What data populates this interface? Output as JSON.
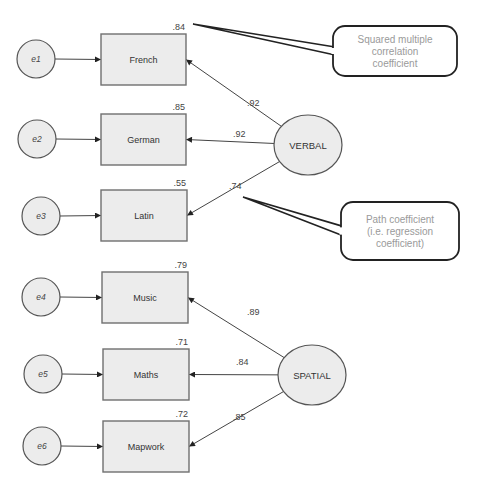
{
  "colors": {
    "node_fill": "#ececec",
    "node_stroke": "#707070",
    "edge": "#444444",
    "callout_text": "#9a9a9a",
    "callout_stroke": "#222222"
  },
  "latent_factors": [
    {
      "id": "VERBAL",
      "label": "VERBAL",
      "cx": 308,
      "cy": 145,
      "rx": 34,
      "ry": 30
    },
    {
      "id": "SPATIAL",
      "label": "SPATIAL",
      "cx": 312,
      "cy": 375,
      "rx": 34,
      "ry": 30
    }
  ],
  "observed": [
    {
      "label": "French",
      "x": 101,
      "y": 34,
      "w": 85,
      "h": 51,
      "r2": ".84",
      "factor": "VERBAL",
      "loading": ".92",
      "error": "e1",
      "ex": 36,
      "ey": 59
    },
    {
      "label": "German",
      "x": 101,
      "y": 114,
      "w": 85,
      "h": 51,
      "r2": ".85",
      "factor": "VERBAL",
      "loading": ".92",
      "error": "e2",
      "ex": 37,
      "ey": 139
    },
    {
      "label": "Latin",
      "x": 101,
      "y": 190,
      "w": 86,
      "h": 51,
      "r2": ".55",
      "factor": "VERBAL",
      "loading": ".74",
      "error": "e3",
      "ex": 41,
      "ey": 216
    },
    {
      "label": "Music",
      "x": 102,
      "y": 272,
      "w": 86,
      "h": 51,
      "r2": ".79",
      "factor": "SPATIAL",
      "loading": ".89",
      "error": "e4",
      "ex": 41,
      "ey": 297
    },
    {
      "label": "Maths",
      "x": 103,
      "y": 349,
      "w": 86,
      "h": 51,
      "r2": ".71",
      "factor": "SPATIAL",
      "loading": ".84",
      "error": "e5",
      "ex": 43,
      "ey": 374
    },
    {
      "label": "Mapwork",
      "x": 103,
      "y": 421,
      "w": 86,
      "h": 51,
      "r2": ".72",
      "factor": "SPATIAL",
      "loading": ".85",
      "error": "e6",
      "ex": 42,
      "ey": 446
    }
  ],
  "loading_label_pos": [
    {
      "x": 247,
      "y": 106
    },
    {
      "x": 233,
      "y": 137
    },
    {
      "x": 229,
      "y": 189
    },
    {
      "x": 247,
      "y": 315
    },
    {
      "x": 236,
      "y": 365
    },
    {
      "x": 233,
      "y": 420
    }
  ],
  "callouts": [
    {
      "id": "squared-multiple-correlation",
      "lines": [
        "Squared multiple",
        "correlation",
        "coefficient"
      ],
      "x": 333,
      "y": 26,
      "w": 124,
      "h": 50,
      "points_to": {
        "x": 193,
        "y": 24
      }
    },
    {
      "id": "path-coefficient",
      "lines": [
        "Path coefficient",
        "(i.e. regression",
        "coefficient)"
      ],
      "x": 341,
      "y": 202,
      "w": 118,
      "h": 58,
      "points_to": {
        "x": 243,
        "y": 197
      }
    }
  ],
  "error_radius": 19
}
